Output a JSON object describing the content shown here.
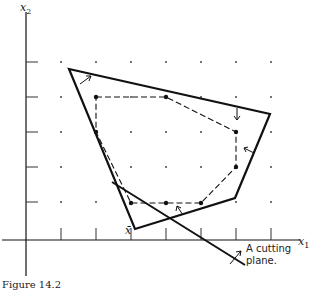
{
  "figure": {
    "caption": "Figure 14.2",
    "axes": {
      "x_label": "x",
      "x_sub": "1",
      "y_label": "x",
      "y_sub": "2",
      "x_ticks": [
        1,
        2,
        3
      ],
      "y_ticks": [
        1,
        2,
        3,
        4,
        5
      ]
    },
    "point_label": "x̄",
    "annotation": {
      "line1": "A cutting",
      "line2": "plane."
    },
    "grid_points": {
      "cols": 7,
      "rows": 5,
      "spacing": 35
    },
    "outer_polygon": [
      [
        69,
        69
      ],
      [
        270,
        114
      ],
      [
        235,
        198
      ],
      [
        135,
        229
      ]
    ],
    "integer_hull": [
      [
        96,
        97
      ],
      [
        166,
        97
      ],
      [
        236,
        132
      ],
      [
        236,
        167
      ],
      [
        201,
        203
      ],
      [
        166,
        203
      ],
      [
        131,
        203
      ],
      [
        96,
        132
      ]
    ],
    "cutting_plane": [
      [
        112,
        182
      ],
      [
        245,
        265
      ]
    ],
    "colors": {
      "ink": "#111111",
      "grid": "#444444"
    }
  }
}
